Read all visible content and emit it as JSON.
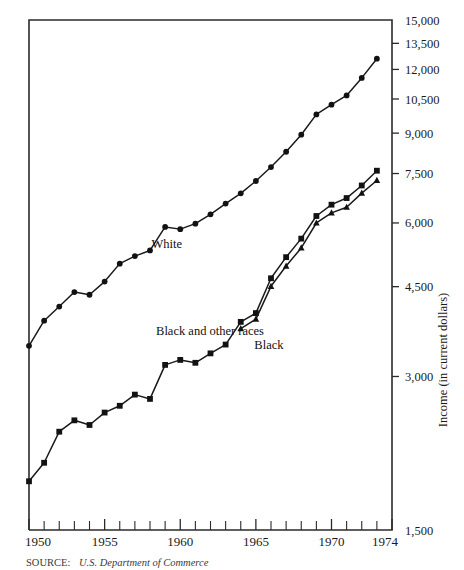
{
  "chart_data": {
    "type": "line",
    "title": "",
    "subtitle": "",
    "xlabel": "",
    "ylabel": "Income (in current dollars)",
    "yscale": "log",
    "ylim": [
      1500,
      15000
    ],
    "xlim": [
      1950,
      1974
    ],
    "grid": false,
    "legend": "inline-labels",
    "y_ticks": [
      15000,
      13500,
      12000,
      10500,
      9000,
      7500,
      6000,
      4500,
      3000,
      1500
    ],
    "y_ticklabels": [
      "15,000",
      "13,500",
      "12,000",
      "10,500",
      "9,000",
      "7,500",
      "6,000",
      "4,500",
      "3,000",
      "1,500"
    ],
    "x_ticks": [
      1950,
      1955,
      1960,
      1965,
      1970,
      1974
    ],
    "x_ticklabels": [
      "1950",
      "1955",
      "1960",
      "1965",
      "1970",
      "1974"
    ],
    "x_minor_ticks": [
      1951,
      1952,
      1953,
      1954,
      1956,
      1957,
      1958,
      1959,
      1961,
      1962,
      1963,
      1964,
      1966,
      1967,
      1968,
      1969,
      1971,
      1972,
      1973
    ],
    "series": [
      {
        "name": "White",
        "marker": "circle",
        "label_x": 1958.1,
        "label_y": 5350,
        "x": [
          1950,
          1951,
          1952,
          1953,
          1954,
          1955,
          1956,
          1957,
          1958,
          1959,
          1960,
          1961,
          1962,
          1963,
          1964,
          1965,
          1966,
          1967,
          1968,
          1969,
          1970,
          1971,
          1972,
          1973
        ],
        "values": [
          3445,
          3859,
          4114,
          4392,
          4339,
          4605,
          4993,
          5166,
          5300,
          5893,
          5835,
          5981,
          6237,
          6548,
          6858,
          7251,
          7722,
          8274,
          8937,
          9794,
          10236,
          10672,
          11549,
          12595
        ]
      },
      {
        "name": "Black and other races",
        "marker": "square",
        "label_x": 1958.4,
        "label_y": 3620,
        "x": [
          1950,
          1951,
          1952,
          1953,
          1954,
          1955,
          1956,
          1957,
          1958,
          1959,
          1960,
          1961,
          1962,
          1963,
          1964,
          1965,
          1966,
          1967,
          1968,
          1969,
          1970,
          1971,
          1972,
          1973
        ],
        "values": [
          1869,
          2032,
          2338,
          2461,
          2410,
          2549,
          2628,
          2764,
          2711,
          3161,
          3233,
          3191,
          3330,
          3465,
          3839,
          3994,
          4674,
          5141,
          5590,
          6191,
          6516,
          6714,
          7106,
          7596
        ]
      },
      {
        "name": "Black",
        "marker": "triangle",
        "label_x": 1964.9,
        "label_y": 3390,
        "x": [
          1964,
          1965,
          1966,
          1967,
          1968,
          1969,
          1970,
          1971,
          1972,
          1973
        ],
        "values": [
          3724,
          3886,
          4507,
          4939,
          5360,
          5999,
          6279,
          6440,
          6864,
          7269
        ]
      }
    ],
    "annotations": []
  },
  "source": {
    "key": "SOURCE:",
    "text": "U.S. Department of Commerce"
  },
  "icons": {
    "circle_marker": "circle-marker-icon",
    "square_marker": "square-marker-icon",
    "triangle_marker": "triangle-marker-icon"
  }
}
